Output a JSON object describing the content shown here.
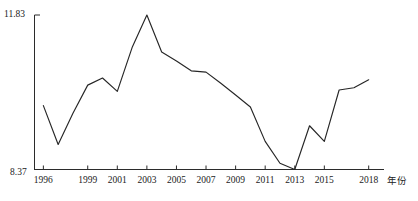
{
  "chart_data": {
    "type": "line",
    "title": "",
    "xlabel": "年份",
    "ylabel": "",
    "xlim": [
      1995.4,
      2018.9
    ],
    "ylim": [
      8.37,
      11.83
    ],
    "grid": false,
    "legend": null,
    "axis": {
      "y_tick_labels": [
        "11.83",
        "8.37"
      ],
      "y_tick_values": [
        11.83,
        8.37
      ],
      "x_tick_labels": [
        "1996",
        "1999",
        "2001",
        "2003",
        "2005",
        "2007",
        "2009",
        "2011",
        "2013",
        "2015",
        "2018"
      ],
      "x_tick_values": [
        1996,
        1999,
        2001,
        2003,
        2005,
        2007,
        2009,
        2011,
        2013,
        2015,
        2018
      ]
    },
    "line_color": "#262626",
    "x": [
      1996,
      1997,
      1998,
      1999,
      2000,
      2001,
      2002,
      2003,
      2004,
      2005,
      2006,
      2007,
      2008,
      2009,
      2010,
      2011,
      2012,
      2013,
      2014,
      2015,
      2016,
      2017,
      2018
    ],
    "values": [
      9.8,
      8.93,
      9.63,
      10.26,
      10.42,
      10.12,
      11.1,
      11.83,
      11.0,
      10.8,
      10.58,
      10.55,
      10.3,
      10.04,
      9.77,
      9.0,
      8.51,
      8.37,
      9.35,
      9.0,
      10.15,
      10.2,
      10.38
    ],
    "series": [
      {
        "name": "series-1",
        "values": [
          9.8,
          8.93,
          9.63,
          10.26,
          10.42,
          10.12,
          11.1,
          11.83,
          11.0,
          10.8,
          10.58,
          10.55,
          10.3,
          10.04,
          9.77,
          9.0,
          8.51,
          8.37,
          9.35,
          9.0,
          10.15,
          10.2,
          10.38
        ]
      }
    ]
  }
}
